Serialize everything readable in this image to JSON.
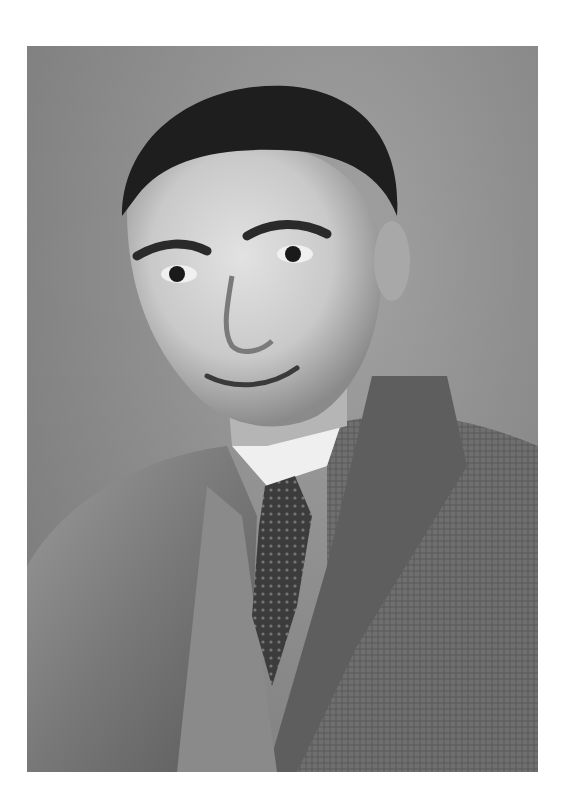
{
  "image": {
    "description": "Vintage black-and-white studio portrait of a man with slicked dark hair wearing a checked tweed suit jacket, vest, white collared shirt and patterned tie",
    "style": "monochrome photograph",
    "colors": {
      "page_background": "#ffffff",
      "photo_background": "#8e8e8e",
      "hair": "#1e1e1e",
      "skin": "#d6d6d6",
      "shirt": "#efefef",
      "jacket": "#6e6e6e",
      "tie": "#3a3a3a"
    },
    "signature": "",
    "frame": {
      "left": 27,
      "top": 46,
      "width": 511,
      "height": 726
    }
  }
}
